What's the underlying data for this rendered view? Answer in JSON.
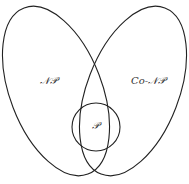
{
  "diagram": {
    "type": "venn",
    "sets": [
      {
        "id": "np",
        "label": "𝒩𝒫"
      },
      {
        "id": "conp",
        "label": "Co-𝒩𝒫"
      },
      {
        "id": "p",
        "label": "𝒫"
      }
    ],
    "relations": [
      "P is subset of NP ∩ Co-NP"
    ],
    "colors": {
      "stroke": "#222222",
      "text": "#333333",
      "background": "#ffffff"
    }
  }
}
